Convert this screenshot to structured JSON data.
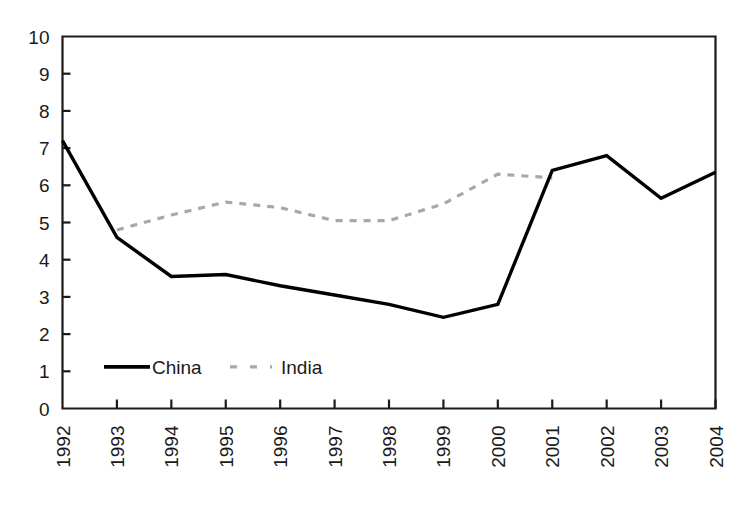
{
  "chart_data": {
    "type": "line",
    "title": "",
    "subtitle": "",
    "xlabel": "",
    "ylabel": "",
    "categories": [
      "1992",
      "1993",
      "1994",
      "1995",
      "1996",
      "1997",
      "1998",
      "1999",
      "2000",
      "2001",
      "2002",
      "2003",
      "2004"
    ],
    "x_tick_labels": [
      "1992",
      "1993",
      "1994",
      "1995",
      "1996",
      "1997",
      "1998",
      "1999",
      "2000",
      "2001",
      "2002",
      "2003",
      "2004"
    ],
    "y_tick_labels": [
      "0",
      "1",
      "2",
      "3",
      "4",
      "5",
      "6",
      "7",
      "8",
      "9",
      "10"
    ],
    "y_ticks": [
      0,
      1,
      2,
      3,
      4,
      5,
      6,
      7,
      8,
      9,
      10
    ],
    "ylim": [
      0,
      10
    ],
    "xlim_index": [
      0,
      12
    ],
    "grid": false,
    "legend_position": "inside-bottom-left",
    "series": [
      {
        "name": "China",
        "style": "solid",
        "color": "#000000",
        "values": [
          7.2,
          4.6,
          3.55,
          3.6,
          3.3,
          3.05,
          2.8,
          2.45,
          2.8,
          6.4,
          6.8,
          5.65,
          6.35
        ]
      },
      {
        "name": "India",
        "style": "dashed",
        "color": "#a8a8a8",
        "values": [
          null,
          4.8,
          5.2,
          5.55,
          5.4,
          5.05,
          5.05,
          5.5,
          6.3,
          6.2,
          null,
          null,
          null
        ]
      }
    ],
    "annotations": []
  },
  "legend": {
    "entries": [
      {
        "label": "China"
      },
      {
        "label": "India"
      }
    ]
  },
  "axes": {
    "frame_color": "#1a1a1a",
    "tick_color": "#1a1a1a",
    "background": "#ffffff"
  }
}
